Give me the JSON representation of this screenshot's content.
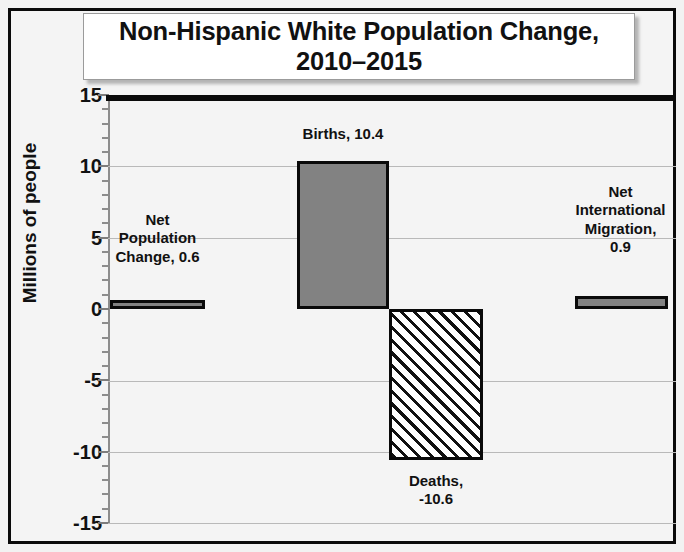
{
  "chart_data": {
    "type": "bar",
    "title_line1": "Non-Hispanic White Population Change,",
    "title_line2": "2010–2015",
    "xlabel": "",
    "ylabel": "Millions of people",
    "ylim": [
      -15,
      15
    ],
    "ytick_labels": [
      "15",
      "10",
      "5",
      "0",
      "-5",
      "-10",
      "-15"
    ],
    "ytick_values": [
      15,
      10,
      5,
      0,
      -5,
      -10,
      -15
    ],
    "minor_tick_step": 1,
    "grid": true,
    "grid_axis": "y",
    "legend": "none",
    "zero_line": true,
    "categories": [
      "Net Population Change",
      "Births",
      "Deaths",
      "Net International Migration"
    ],
    "values": [
      0.6,
      10.4,
      -10.6,
      0.9
    ],
    "data_labels": [
      "Net\nPopulation\nChange, 0.6",
      "Births, 10.4",
      "Deaths,\n-10.6",
      "Net\nInternational\nMigration,\n0.9"
    ],
    "bars": [
      {
        "name": "net-population-change",
        "label": "Net\nPopulation\nChange, 0.6",
        "value": 0.6,
        "fill": "#828282",
        "pattern": "solid",
        "edge_color": "#0a0a0a"
      },
      {
        "name": "births",
        "label": "Births, 10.4",
        "value": 10.4,
        "fill": "#828282",
        "pattern": "solid",
        "edge_color": "#0a0a0a"
      },
      {
        "name": "deaths",
        "label": "Deaths,\n-10.6",
        "value": -10.6,
        "fill": "#ffffff",
        "pattern": "diagonal-hatch",
        "edge_color": "#0a0a0a"
      },
      {
        "name": "net-international-migration",
        "label": "Net\nInternational\nMigration,\n0.9",
        "value": 0.9,
        "fill": "#828282",
        "pattern": "solid",
        "edge_color": "#0a0a0a"
      }
    ],
    "colors": {
      "bar_fill": "#828282",
      "bar_edge": "#0a0a0a",
      "gridline": "#b9b9b9",
      "zero_line": "#0a0a0a",
      "plot_background": "#f4f4f4",
      "frame": "#0a0a0a",
      "title_background": "#ffffff",
      "text": "#111111"
    }
  }
}
